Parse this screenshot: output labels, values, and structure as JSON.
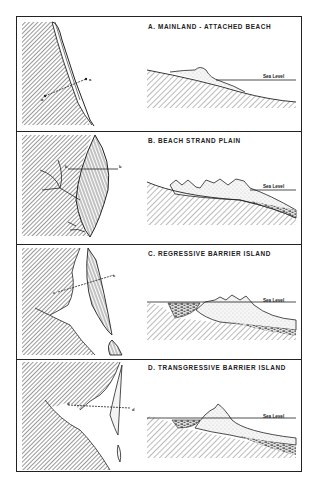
{
  "figure": {
    "panels": [
      {
        "id": "A",
        "title": "A. MAINLAND - ATTACHED BEACH",
        "sea_label": "Sea Level",
        "section_labels": [
          "a",
          "a"
        ]
      },
      {
        "id": "B",
        "title": "B. BEACH STRAND PLAIN",
        "sea_label": "Sea Level",
        "section_labels": [
          "b",
          "b"
        ]
      },
      {
        "id": "C",
        "title": "C. REGRESSIVE BARRIER ISLAND",
        "sea_label": "Sea Level",
        "section_labels": [
          "c",
          "c"
        ]
      },
      {
        "id": "D",
        "title": "D. TRANSGRESSIVE BARRIER ISLAND",
        "sea_label": "Sea Level",
        "section_labels": [
          "d",
          "d"
        ]
      }
    ]
  },
  "colors": {
    "ink": "#222222",
    "paper": "#ffffff",
    "sand": "#f3f3f3"
  }
}
